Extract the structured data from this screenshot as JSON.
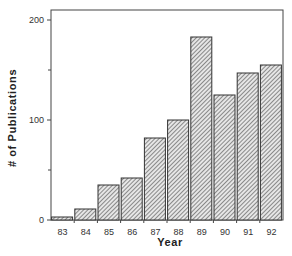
{
  "chart_data": {
    "type": "bar",
    "title": "",
    "xlabel": "Year",
    "ylabel": "# of Publications",
    "categories": [
      "83",
      "84",
      "85",
      "86",
      "87",
      "88",
      "89",
      "90",
      "91",
      "92"
    ],
    "values": [
      3,
      11,
      35,
      42,
      82,
      100,
      183,
      125,
      147,
      155
    ],
    "ylim": [
      0,
      210
    ],
    "yticks": [
      0,
      100,
      200
    ],
    "yminor_ticks": [
      50,
      150
    ],
    "grid": false,
    "legend": null,
    "bar_fill": "diagonal-hatch",
    "colors": {
      "bar_stroke": "#333333",
      "hatch": "#555555",
      "axis": "#333333"
    }
  }
}
